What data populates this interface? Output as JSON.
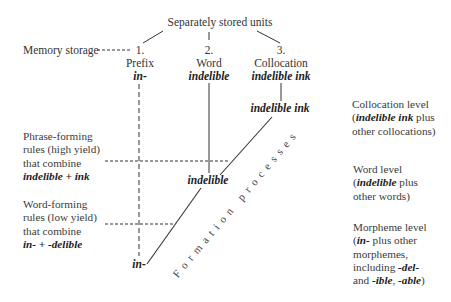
{
  "title": "Separately stored units",
  "memory_storage_label": "Memory storage",
  "columns": [
    {
      "number": "1.",
      "type": "Prefix",
      "example": "in-"
    },
    {
      "number": "2.",
      "type": "Word",
      "example": "indelible"
    },
    {
      "number": "3.",
      "type": "Collocation",
      "example": "indelible ink"
    }
  ],
  "rules": {
    "phrase_forming": {
      "lines": [
        "Phrase-forming",
        "rules (high yield)",
        "that combine"
      ],
      "example_a": "indelible",
      "plus": "+",
      "example_b": "ink"
    },
    "word_forming": {
      "lines": [
        "Word-forming",
        "rules (low yield)",
        "that combine"
      ],
      "example_a": "in-",
      "plus": "+",
      "example_b": "-delible"
    }
  },
  "diagonal_nodes": {
    "top": "indelible ink",
    "middle": "indelible",
    "bottom": "in-"
  },
  "diagonal_label": "Formation processes",
  "levels": {
    "collocation": {
      "title": "Collocation level",
      "open": "(",
      "example": "indelible ink",
      "rest1": " plus",
      "line3": "other collocations)"
    },
    "word": {
      "title": "Word level",
      "open": "(",
      "example": "indelible",
      "rest1": " plus",
      "line3": "other words)"
    },
    "morpheme": {
      "title": "Morpheme level",
      "open": "(",
      "example": "in-",
      "rest1": " plus other",
      "line3": "morphemes,",
      "line4_pre": "including ",
      "line4_example": "-del-",
      "line5_pre": "and ",
      "line5_ex1": "-ible",
      "line5_sep": ", ",
      "line5_ex2": "-able",
      "line5_close": ")"
    }
  },
  "colors": {
    "line": "#333333",
    "text": "#333333",
    "background": "#ffffff"
  }
}
